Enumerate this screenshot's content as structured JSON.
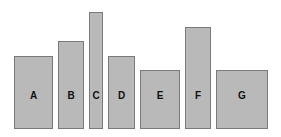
{
  "diagram": {
    "type": "block-diagram",
    "baseline_y": 129,
    "label_center_y": 96,
    "fill_color": "#b9b9b9",
    "border_color": "#7a7a7a",
    "label_color": "#111111",
    "blocks": [
      {
        "label": "A",
        "x": 14,
        "top": 56,
        "width": 39
      },
      {
        "label": "B",
        "x": 58,
        "top": 41,
        "width": 26
      },
      {
        "label": "C",
        "x": 89,
        "top": 12,
        "width": 14
      },
      {
        "label": "D",
        "x": 108,
        "top": 56,
        "width": 27
      },
      {
        "label": "E",
        "x": 140,
        "top": 70,
        "width": 40
      },
      {
        "label": "F",
        "x": 185,
        "top": 27,
        "width": 26
      },
      {
        "label": "G",
        "x": 216,
        "top": 70,
        "width": 52
      }
    ]
  }
}
